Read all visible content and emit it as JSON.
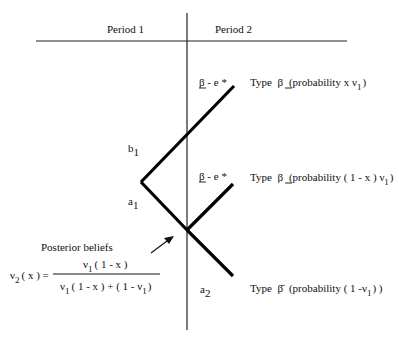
{
  "header": {
    "period1": "Period 1",
    "period2": "Period 2"
  },
  "nodes": {
    "b1": {
      "base": "b",
      "sub": "1"
    },
    "a1": {
      "base": "a",
      "sub": "1"
    },
    "a2": {
      "base": "a",
      "sub": "2"
    }
  },
  "branch_labels": {
    "top": "β - e *",
    "middle": "β - e *"
  },
  "outcomes": [
    {
      "type_label": "Type",
      "beta": "β",
      "prob": "(probability  x ν",
      "sub": "1",
      "close": ")"
    },
    {
      "type_label": "Type",
      "beta": "β",
      "prob": "(probability  ( 1 - x ) ν",
      "sub": "1",
      "close": ")"
    },
    {
      "type_label": "Type",
      "beta": "β̄",
      "prob": "(probability  ( 1 -ν",
      "sub": "1",
      "close": ") )"
    }
  ],
  "posterior": {
    "title": "Posterior beliefs",
    "lhs": "ν",
    "lhs_sub": "2",
    "lhs_rest": "( x ) =",
    "numerator": {
      "a": "ν",
      "a_sub": "1",
      "rest": "( 1 - x )"
    },
    "denominator": {
      "a": "ν",
      "a_sub": "1",
      "mid": "( 1 - x ) + ( 1 - ν",
      "b_sub": "1",
      "end": ")"
    }
  }
}
